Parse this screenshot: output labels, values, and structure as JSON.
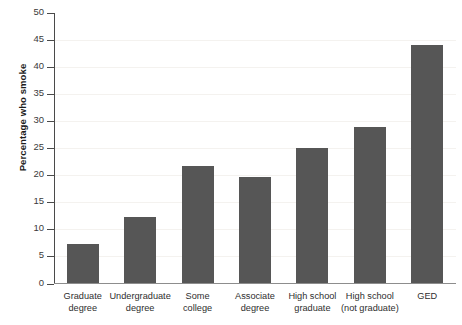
{
  "chart_data": {
    "type": "bar",
    "title": "",
    "xlabel": "",
    "ylabel": "Percentage who smoke",
    "categories": [
      "Graduate\ndegree",
      "Undergraduate\ndegree",
      "Some\ncollege",
      "Associate\ndegree",
      "High school\ngraduate",
      "High school\n(not graduate)",
      "GED"
    ],
    "values": [
      7.2,
      12.2,
      21.5,
      19.5,
      25.0,
      28.8,
      44.0
    ],
    "ylim": [
      0,
      50
    ],
    "ytick_labels": [
      "0",
      "5",
      "10",
      "15",
      "20",
      "25",
      "30",
      "35",
      "40",
      "45",
      "50"
    ],
    "ytick_values": [
      0,
      5,
      10,
      15,
      20,
      25,
      30,
      35,
      40,
      45,
      50
    ],
    "grid": false,
    "legend": "none",
    "bar_color": "#565656",
    "axis_color": "#4a4a4a",
    "background_color": "#ffffff"
  }
}
